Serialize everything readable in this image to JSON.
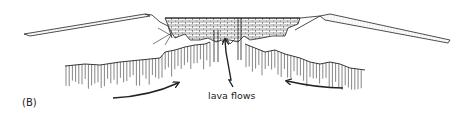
{
  "figure": {
    "panel_label": "(B)",
    "annotations": {
      "lava_flows": "lava flows"
    },
    "elements": [
      {
        "id": "left-volcanic-slope",
        "description": "thin layered crust sloping up from the left toward the rift"
      },
      {
        "id": "right-volcanic-slope",
        "description": "thin layered crust sloping down to the right away from the rift"
      },
      {
        "id": "central-lava-pile",
        "description": "brick-patterned stacked lava flows filling the central graben"
      },
      {
        "id": "feeder-dikes",
        "description": "vertical dikes beneath the rift feeding lava flows"
      },
      {
        "id": "mantle-left",
        "description": "hatched rising mantle beneath left side"
      },
      {
        "id": "mantle-right",
        "description": "hatched rising mantle beneath right side"
      },
      {
        "id": "arrow-left-converging",
        "description": "curved arrow pointing up and inward from the left"
      },
      {
        "id": "arrow-right-converging",
        "description": "curved arrow pointing up and inward from the right"
      },
      {
        "id": "lava-flows-pointer",
        "description": "zigzag arrow pointing up to the lava flows"
      }
    ],
    "colors": {
      "ink": "#222222",
      "background": "#ffffff"
    }
  }
}
